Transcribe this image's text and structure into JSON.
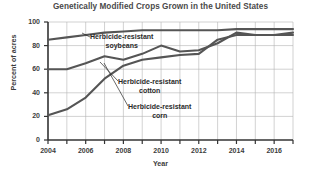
{
  "chart_data": {
    "type": "line",
    "title": "Genetically Modified Crops Grown in the United States",
    "xlabel": "Year",
    "ylabel": "Percent of acres",
    "xlim": [
      2004,
      2017
    ],
    "ylim": [
      0,
      100
    ],
    "grid": true,
    "legend_position": "inline-annotations",
    "x": [
      2004,
      2005,
      2006,
      2007,
      2008,
      2009,
      2010,
      2011,
      2012,
      2013,
      2014,
      2015,
      2016,
      2017
    ],
    "y_ticks": [
      0,
      20,
      40,
      60,
      80,
      100
    ],
    "y_tick_labels": [
      "0",
      "20",
      "40",
      "60",
      "80",
      "100"
    ],
    "x_ticks": [
      2004,
      2006,
      2008,
      2010,
      2012,
      2014,
      2016
    ],
    "x_tick_labels": [
      "2004",
      "2006",
      "2008",
      "2010",
      "2012",
      "2014",
      "2016"
    ],
    "x_minor_ticks": [
      2005,
      2007,
      2009,
      2011,
      2013,
      2015,
      2017
    ],
    "series": [
      {
        "name": "Herbicide-resistant soybeans",
        "color": "#555555",
        "values": [
          85,
          87,
          89,
          91,
          92,
          93,
          93,
          93,
          93,
          93,
          94,
          94,
          94,
          94
        ]
      },
      {
        "name": "Herbicide-resistant cotton",
        "color": "#555555",
        "values": [
          60,
          60,
          65,
          71,
          68,
          73,
          80,
          75,
          76,
          82,
          91,
          89,
          89,
          91
        ]
      },
      {
        "name": "Herbicide-resistant corn",
        "color": "#555555",
        "values": [
          21,
          26,
          36,
          52,
          63,
          68,
          70,
          72,
          73,
          85,
          89,
          89,
          89,
          89
        ]
      }
    ],
    "annotations": [
      {
        "id": "soybeans",
        "line1": "Herbicide-resistant",
        "line2": "soybeans",
        "target_series": "Herbicide-resistant soybeans"
      },
      {
        "id": "cotton",
        "line1": "Herbicide-resistant",
        "line2": "cotton",
        "target_series": "Herbicide-resistant cotton"
      },
      {
        "id": "corn",
        "line1": "Herbicide-resistant",
        "line2": "corn",
        "target_series": "Herbicide-resistant corn"
      }
    ]
  },
  "axes": {
    "y_tick_labels": [
      "100",
      "80",
      "60",
      "40",
      "20",
      "0"
    ],
    "x_tick_labels": [
      "2004",
      "2006",
      "2008",
      "2010",
      "2012",
      "2014",
      "2016"
    ],
    "ylabel": "Percent of acres",
    "xlabel": "Year"
  },
  "title": "Genetically Modified Crops Grown in the United States",
  "colors": {
    "line": "#555555",
    "grid": "#b4b4b4",
    "axis": "#333333",
    "title_text": "#4a4a4a",
    "tick_text": "#3c3c3c",
    "background": "#ffffff"
  }
}
